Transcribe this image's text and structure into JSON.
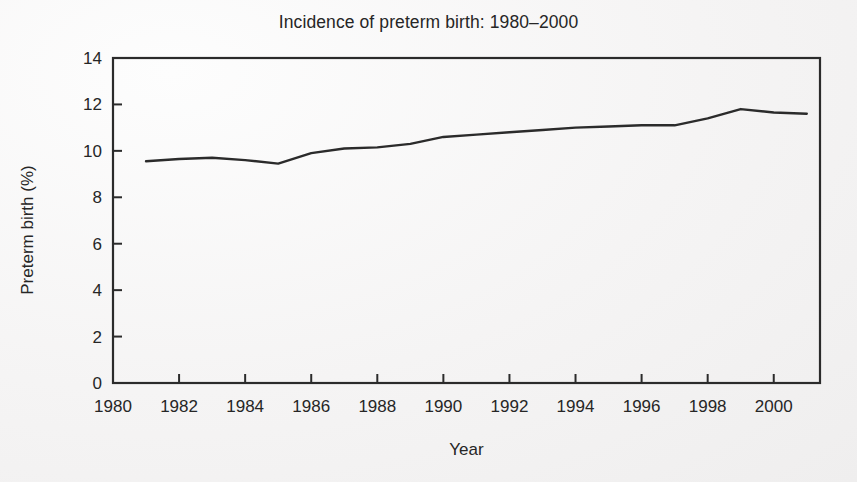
{
  "chart_data": {
    "type": "line",
    "title": "Incidence of preterm birth: 1980–2000",
    "xlabel": "Year",
    "ylabel": "Preterm birth (%)",
    "xlim": [
      1980,
      2001.4
    ],
    "ylim": [
      0,
      14
    ],
    "grid": false,
    "legend": null,
    "x_ticks": [
      1980,
      1982,
      1984,
      1986,
      1988,
      1990,
      1992,
      1994,
      1996,
      1998,
      2000
    ],
    "x_tick_labels": [
      "1980",
      "1982",
      "1984",
      "1986",
      "1988",
      "1990",
      "1992",
      "1994",
      "1996",
      "1998",
      "2000"
    ],
    "y_ticks": [
      0,
      2,
      4,
      6,
      8,
      10,
      12,
      14
    ],
    "y_tick_labels": [
      "0",
      "2",
      "4",
      "6",
      "8",
      "10",
      "12",
      "14"
    ],
    "series": [
      {
        "name": "Preterm birth rate",
        "color": "#2b2b2b",
        "x": [
          1981,
          1982,
          1983,
          1984,
          1985,
          1986,
          1987,
          1988,
          1989,
          1990,
          1991,
          1992,
          1993,
          1994,
          1995,
          1996,
          1997,
          1998,
          1999,
          2000,
          2001
        ],
        "values": [
          9.55,
          9.65,
          9.7,
          9.6,
          9.45,
          9.9,
          10.1,
          10.15,
          10.3,
          10.6,
          10.7,
          10.8,
          10.9,
          11.0,
          11.05,
          11.1,
          11.1,
          11.4,
          11.8,
          11.65,
          11.6
        ]
      }
    ]
  },
  "style": {
    "background": "#f6f5f5",
    "axis_color": "#2b2b2b",
    "line_color": "#2b2b2b",
    "text_color": "#262626"
  },
  "geometry": {
    "plot_left": 113,
    "plot_right": 820,
    "plot_top": 58,
    "plot_bottom": 383
  }
}
